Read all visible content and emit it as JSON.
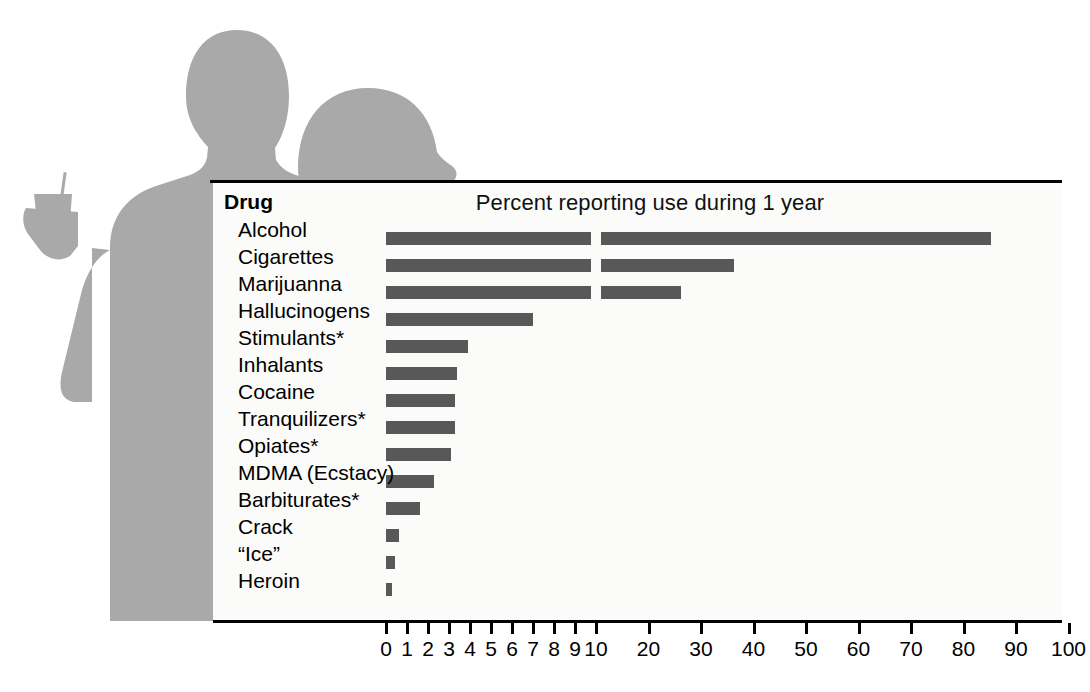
{
  "chart_data": {
    "type": "bar",
    "orientation": "horizontal",
    "title": "Percent reporting use during 1 year",
    "category_header": "Drug",
    "xlabel": "",
    "ylabel": "",
    "xlim": [
      0,
      100
    ],
    "grid": false,
    "legend": null,
    "axis_break": {
      "at": 10,
      "note": "Scale changes at 10: 0-10 in single-unit steps, 10-100 in steps of 10"
    },
    "tick_labels": [
      "0",
      "1",
      "2",
      "3",
      "4",
      "5",
      "6",
      "7",
      "8",
      "9",
      "10",
      "20",
      "30",
      "40",
      "50",
      "60",
      "70",
      "80",
      "90",
      "100"
    ],
    "tick_values": [
      0,
      1,
      2,
      3,
      4,
      5,
      6,
      7,
      8,
      9,
      10,
      20,
      30,
      40,
      50,
      60,
      70,
      80,
      90,
      100
    ],
    "categories": [
      "Alcohol",
      "Cigarettes",
      "Marijuanna",
      "Hallucinogens",
      "Stimulants*",
      "Inhalants",
      "Cocaine",
      "Tranquilizers*",
      "Opiates*",
      "MDMA (Ecstacy)",
      "Barbiturates*",
      "Crack",
      "“Ice”",
      "Heroin"
    ],
    "values": [
      85.2,
      36.3,
      26.2,
      7.0,
      3.9,
      3.4,
      3.3,
      3.3,
      3.1,
      2.3,
      1.6,
      0.6,
      0.45,
      0.3
    ],
    "bar_color": "#585858",
    "plot_background": "#fbfbfa",
    "silhouette_color": "#a9a9a9"
  },
  "decoration": {
    "figure_left_name": "male-silhouette",
    "figure_right_name": "female-silhouette",
    "cup_name": "drink-cup-shape"
  }
}
